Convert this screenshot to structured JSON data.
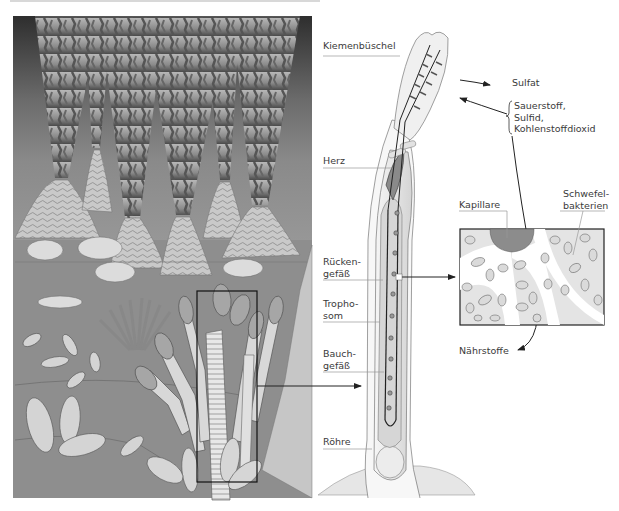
{
  "figure": {
    "left_panel": {
      "description": "Hydrothermal vent field with black smokers and tube worm colonies",
      "highlight_box": "Selected tube worm cluster"
    },
    "right_panel": {
      "labels": {
        "kiemenbuschel": "Kiemenbüschel",
        "herz": "Herz",
        "ruckengefass": "Rücken-\ngefäß",
        "trophosom": "Tropho-\nsom",
        "bauchgefass": "Bauch-\ngefäß",
        "rohre": "Röhre",
        "sulfat": "Sulfat",
        "inputs": "Sauerstoff,\nSulfid,\nKohlenstoffdioxid",
        "kapillare": "Kapillare",
        "schwefelbakterien": "Schwefel-\nbakterien",
        "nahrstoffe": "Nährstoffe"
      }
    }
  },
  "colors": {
    "background": "#ffffff",
    "scene_dark": "#3a3a3a",
    "scene_mid": "#7a7a7a",
    "scene_light": "#bdbdbd",
    "worm_fill": "#eeeeee",
    "trophosome_fill": "#d6d6d6",
    "capillary_fill": "#8c8c8c",
    "line": "#222222",
    "label_text": "#3a3a3a",
    "leader_line": "#9a9a9a"
  }
}
